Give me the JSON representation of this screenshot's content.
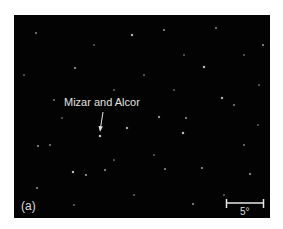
{
  "figure": {
    "panel_label": "(a)",
    "annotation": "Mizar and Alcor",
    "scale_bar_label": "5°",
    "background_color": "#030303",
    "star_color": "#ffffff"
  },
  "stars": [
    {
      "x": 86,
      "y": 121,
      "r": 1.4,
      "o": 0.95
    },
    {
      "x": 113,
      "y": 113,
      "r": 1.1,
      "o": 0.8
    },
    {
      "x": 118,
      "y": 20,
      "r": 1.3,
      "o": 0.85
    },
    {
      "x": 190,
      "y": 52,
      "r": 1.3,
      "o": 0.9
    },
    {
      "x": 208,
      "y": 83,
      "r": 1.2,
      "o": 0.85
    },
    {
      "x": 169,
      "y": 118,
      "r": 1.3,
      "o": 0.9
    },
    {
      "x": 145,
      "y": 102,
      "r": 1.0,
      "o": 0.7
    },
    {
      "x": 172,
      "y": 103,
      "r": 0.9,
      "o": 0.55
    },
    {
      "x": 59,
      "y": 157,
      "r": 1.3,
      "o": 0.9
    },
    {
      "x": 72,
      "y": 160,
      "r": 0.9,
      "o": 0.6
    },
    {
      "x": 91,
      "y": 155,
      "r": 0.9,
      "o": 0.55
    },
    {
      "x": 24,
      "y": 131,
      "r": 0.9,
      "o": 0.55
    },
    {
      "x": 36,
      "y": 130,
      "r": 0.8,
      "o": 0.45
    },
    {
      "x": 23,
      "y": 173,
      "r": 0.8,
      "o": 0.5
    },
    {
      "x": 61,
      "y": 53,
      "r": 1.0,
      "o": 0.6
    },
    {
      "x": 22,
      "y": 18,
      "r": 0.8,
      "o": 0.45
    },
    {
      "x": 150,
      "y": 15,
      "r": 0.8,
      "o": 0.5
    },
    {
      "x": 202,
      "y": 13,
      "r": 0.8,
      "o": 0.45
    },
    {
      "x": 249,
      "y": 30,
      "r": 0.9,
      "o": 0.55
    },
    {
      "x": 220,
      "y": 90,
      "r": 0.8,
      "o": 0.45
    },
    {
      "x": 188,
      "y": 153,
      "r": 1.0,
      "o": 0.6
    },
    {
      "x": 236,
      "y": 159,
      "r": 1.0,
      "o": 0.6
    },
    {
      "x": 151,
      "y": 154,
      "r": 0.8,
      "o": 0.5
    },
    {
      "x": 179,
      "y": 189,
      "r": 0.9,
      "o": 0.55
    },
    {
      "x": 40,
      "y": 85,
      "r": 0.7,
      "o": 0.4
    },
    {
      "x": 100,
      "y": 75,
      "r": 0.7,
      "o": 0.35
    },
    {
      "x": 130,
      "y": 60,
      "r": 0.7,
      "o": 0.35
    },
    {
      "x": 230,
      "y": 130,
      "r": 0.7,
      "o": 0.4
    },
    {
      "x": 245,
      "y": 70,
      "r": 0.7,
      "o": 0.35
    },
    {
      "x": 60,
      "y": 190,
      "r": 0.7,
      "o": 0.35
    },
    {
      "x": 120,
      "y": 180,
      "r": 0.7,
      "o": 0.35
    },
    {
      "x": 210,
      "y": 180,
      "r": 0.7,
      "o": 0.35
    },
    {
      "x": 80,
      "y": 30,
      "r": 0.6,
      "o": 0.3
    },
    {
      "x": 170,
      "y": 40,
      "r": 0.6,
      "o": 0.3
    },
    {
      "x": 10,
      "y": 60,
      "r": 0.6,
      "o": 0.3
    },
    {
      "x": 140,
      "y": 140,
      "r": 0.6,
      "o": 0.3
    },
    {
      "x": 48,
      "y": 103,
      "r": 0.6,
      "o": 0.3
    },
    {
      "x": 100,
      "y": 145,
      "r": 0.6,
      "o": 0.3
    },
    {
      "x": 160,
      "y": 75,
      "r": 0.6,
      "o": 0.3
    },
    {
      "x": 230,
      "y": 40,
      "r": 0.6,
      "o": 0.3
    },
    {
      "x": 244,
      "y": 110,
      "r": 0.6,
      "o": 0.3
    }
  ]
}
